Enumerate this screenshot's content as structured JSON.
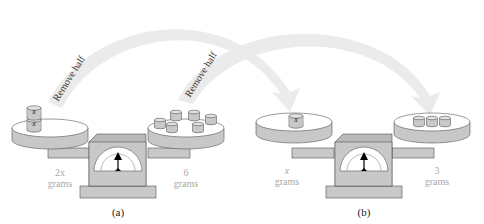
{
  "figure": {
    "colors": {
      "arrow": "#ebebeb",
      "scale_body": "#c8c8c8",
      "scale_dark": "#b0b0b0",
      "outline": "#555555",
      "label_gray": "#a8a8a8"
    },
    "arrows": [
      {
        "label": "Remove half",
        "from": "left pan (a)",
        "to": "left pan (b)"
      },
      {
        "label": "Remove half",
        "from": "right pan (a)",
        "to": "right pan (b)"
      }
    ],
    "panels": [
      {
        "caption": "(a)",
        "left_pan": {
          "weight_value": "2x",
          "weight_unit": "grams",
          "cylinders": [
            "x",
            "x"
          ]
        },
        "right_pan": {
          "weight_value": "6",
          "weight_unit": "grams",
          "cylinder_count": 6
        }
      },
      {
        "caption": "(b)",
        "left_pan": {
          "weight_value": "x",
          "weight_unit": "grams",
          "cylinders": [
            "x"
          ]
        },
        "right_pan": {
          "weight_value": "3",
          "weight_unit": "grams",
          "cylinder_count": 3
        }
      }
    ]
  }
}
